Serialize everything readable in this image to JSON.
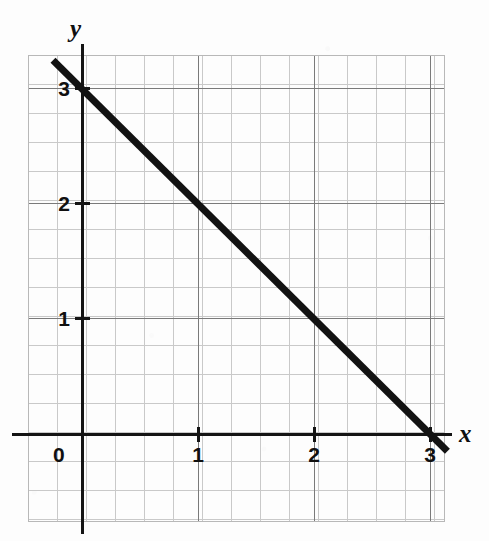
{
  "figure": {
    "name": "coordinate-plane-linear-graph",
    "background_color": "#fdfdfd",
    "line_color": "#121212",
    "grid_minor_color": "#c9c9c9",
    "grid_major_color": "#7a7a7a",
    "axis_color": "#141414"
  },
  "axes": {
    "x_label": "x",
    "y_label": "y",
    "origin_label": "0",
    "x_ticks": [
      {
        "value": 1,
        "label": "1",
        "px": 198
      },
      {
        "value": 2,
        "label": "2",
        "px": 314
      },
      {
        "value": 3,
        "label": "3",
        "px": 430
      }
    ],
    "y_ticks": [
      {
        "value": 1,
        "label": "1",
        "px": 318
      },
      {
        "value": 2,
        "label": "2",
        "px": 203
      },
      {
        "value": 3,
        "label": "3",
        "px": 88
      }
    ]
  },
  "chart_data": {
    "type": "line",
    "title": "",
    "subtitle": "",
    "xlabel": "x",
    "ylabel": "y",
    "xlim": [
      -0.47,
      3.13
    ],
    "ylim": [
      -0.77,
      3.3
    ],
    "grid": true,
    "grid_minor_step": 0.25,
    "grid_major_step": 1,
    "legend": false,
    "legend_position": "none",
    "annotations": [],
    "series": [
      {
        "name": "y = -x + 3",
        "equation": "y = -x + 3",
        "slope": -1,
        "y_intercept": 3,
        "x_intercept": 3,
        "x": [
          -0.25,
          0,
          1,
          2,
          3,
          3.15
        ],
        "y": [
          3.25,
          3,
          2,
          1,
          0,
          -0.15
        ],
        "points_of_interest": [
          {
            "label": "y-intercept",
            "x": 0,
            "y": 3
          },
          {
            "label": "point",
            "x": 1,
            "y": 2
          },
          {
            "label": "point",
            "x": 2,
            "y": 1
          },
          {
            "label": "x-intercept",
            "x": 3,
            "y": 0
          }
        ],
        "color": "#121212",
        "line_width": 7
      }
    ]
  }
}
